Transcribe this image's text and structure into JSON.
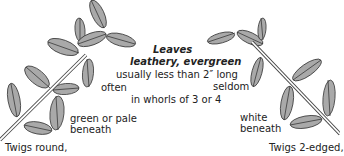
{
  "heading": {
    "title": "Leaves",
    "subtitle": "leathery, evergreen"
  },
  "center_text": {
    "size_note": "usually less than 2″ long",
    "often": "often",
    "seldom": "seldom",
    "whorls": "in whorls of 3 or 4"
  },
  "left_specimen": {
    "underside": [
      "green or pale",
      "beneath"
    ],
    "twig": "Twigs round,"
  },
  "right_specimen": {
    "underside": [
      "white",
      "beneath"
    ],
    "twig": "Twigs 2-edged,"
  },
  "colors": {
    "leaf_fill": "#a9a9a9",
    "outline": "#3a3a3a",
    "background": "#ffffff"
  }
}
